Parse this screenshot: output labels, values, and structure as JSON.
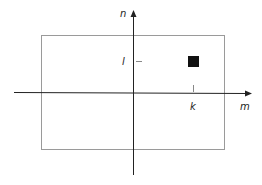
{
  "diagram": {
    "type": "coordinate-plane",
    "axes": {
      "horizontal_label": "m",
      "vertical_label": "n"
    },
    "ticks": {
      "horizontal_tick_label": "k",
      "vertical_tick_label": "l"
    },
    "elements": [
      {
        "kind": "rectangle",
        "description": "bounding frame",
        "stroke": "#9a9a9a"
      },
      {
        "kind": "filled-square",
        "description": "point at (k, l)",
        "fill": "#111111"
      }
    ],
    "colors": {
      "axis": "#222222",
      "frame": "#9a9a9a",
      "square": "#111111",
      "tick": "#888888"
    }
  }
}
